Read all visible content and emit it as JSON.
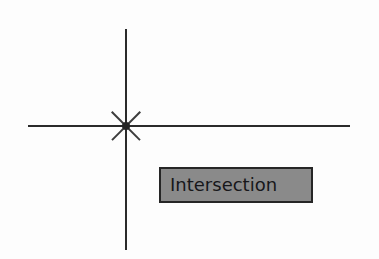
{
  "figure": {
    "background_color": "#fdfdfd",
    "line_color": "#2a2a2a",
    "marker_color": "#3c3c3c"
  },
  "geometry": {
    "horizontal_line": {
      "name": "horizontal-line",
      "x1": 28,
      "y1": 126,
      "x2": 350,
      "y2": 126,
      "thickness": 2
    },
    "vertical_line": {
      "name": "vertical-line",
      "x1": 126,
      "y1": 29,
      "x2": 126,
      "y2": 250,
      "thickness": 2
    },
    "intersection_point": {
      "name": "intersection-point",
      "x": 126,
      "y": 126
    }
  },
  "snap_marker": {
    "icon": "intersection-snap-x-icon",
    "type": "X",
    "size": 38,
    "center_x": 126,
    "center_y": 126
  },
  "tooltip": {
    "label": "Intersection",
    "fill_color": "#8a8a8a",
    "border_color": "#262626",
    "text_color": "#17171a",
    "x": 159,
    "y": 167,
    "width": 154,
    "height": 36
  },
  "ghost_text": {
    "top": "",
    "mid": "",
    "mid2": "",
    "low": "",
    "bottom": ""
  }
}
